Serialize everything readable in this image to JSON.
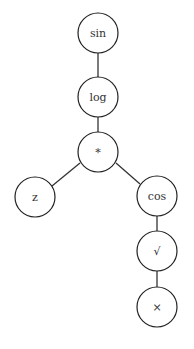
{
  "diagram": {
    "type": "expression-tree",
    "nodes": [
      {
        "id": "n0",
        "label": "sin",
        "x": 98,
        "y": 33
      },
      {
        "id": "n1",
        "label": "log",
        "x": 98,
        "y": 97
      },
      {
        "id": "n2",
        "label": "*",
        "x": 98,
        "y": 152
      },
      {
        "id": "n3",
        "label": "z",
        "x": 35,
        "y": 197
      },
      {
        "id": "n4",
        "label": "cos",
        "x": 157,
        "y": 196
      },
      {
        "id": "n5",
        "label": "√",
        "x": 157,
        "y": 251
      },
      {
        "id": "n6",
        "label": "×",
        "x": 157,
        "y": 307
      }
    ],
    "edges": [
      {
        "from": "n0",
        "to": "n1"
      },
      {
        "from": "n1",
        "to": "n2"
      },
      {
        "from": "n2",
        "to": "n3"
      },
      {
        "from": "n2",
        "to": "n4"
      },
      {
        "from": "n4",
        "to": "n5"
      },
      {
        "from": "n5",
        "to": "n6"
      }
    ],
    "node_radius": 20
  }
}
